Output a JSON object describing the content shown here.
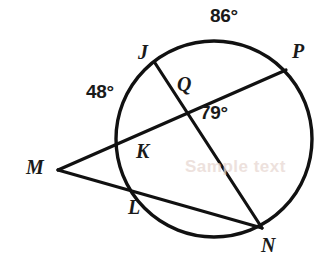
{
  "figure": {
    "kind": "circle-geometry-diagram",
    "width": 329,
    "height": 271,
    "background_color": "#ffffff",
    "stroke_color": "#111111",
    "text_color": "#1a1a1a"
  },
  "circle": {
    "name": "circle-Q",
    "center_x": 214,
    "center_y": 139,
    "radius": 98,
    "stroke_width": 3.4
  },
  "points": {
    "J": {
      "label": "J",
      "x": 155,
      "y": 63,
      "label_x": 138,
      "label_y": 42
    },
    "P": {
      "label": "P",
      "x": 286,
      "y": 70,
      "label_x": 292,
      "label_y": 41
    },
    "Q": {
      "label": "Q",
      "x": 185,
      "y": 108,
      "label_x": 177,
      "label_y": 74
    },
    "K": {
      "label": "K",
      "x": 122,
      "y": 137,
      "label_x": 136,
      "label_y": 141
    },
    "L": {
      "label": "L",
      "x": 135,
      "y": 193,
      "label_x": 128,
      "label_y": 197
    },
    "M": {
      "label": "M",
      "x": 58,
      "y": 170,
      "label_x": 26,
      "label_y": 157
    },
    "N": {
      "label": "N",
      "x": 262,
      "y": 228,
      "label_x": 261,
      "label_y": 235
    }
  },
  "segments": [
    {
      "name": "chord-J-N",
      "from": "J",
      "to": "N"
    },
    {
      "name": "secant-M-P",
      "from": "M",
      "to": "P"
    },
    {
      "name": "secant-M-N",
      "from": "M",
      "to": "N"
    }
  ],
  "measures": {
    "arc_JP": {
      "label": "86°",
      "value": 86,
      "x": 210,
      "y": 6
    },
    "arc_JK": {
      "label": "48°",
      "value": 48,
      "x": 86,
      "y": 82
    },
    "angle_Q": {
      "label": "79°",
      "value": 79,
      "x": 200,
      "y": 103
    }
  },
  "watermark": {
    "text": "Sample text",
    "x": 185,
    "y": 157,
    "color": "#e8d8d2"
  }
}
